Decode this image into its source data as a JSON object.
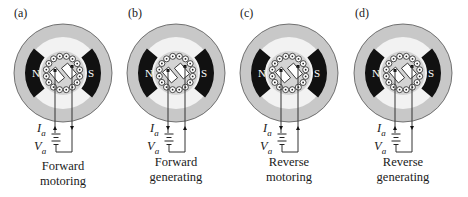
{
  "figure": {
    "panels": [
      {
        "id": "a",
        "label": "(a)",
        "caption_line1": "Forward",
        "caption_line2": "motoring",
        "mode": "forward-motoring",
        "current_left": "up",
        "current_right": "down",
        "cx": 63
      },
      {
        "id": "b",
        "label": "(b)",
        "caption_line1": "Forward",
        "caption_line2": "generating",
        "mode": "forward-generating",
        "current_left": "down",
        "current_right": "up",
        "cx": 176
      },
      {
        "id": "c",
        "label": "(c)",
        "caption_line1": "Reverse",
        "caption_line2": "motoring",
        "mode": "reverse-motoring",
        "current_left": "down",
        "current_right": "up",
        "cx": 289
      },
      {
        "id": "d",
        "label": "(d)",
        "caption_line1": "Reverse",
        "caption_line2": "generating",
        "mode": "reverse-generating",
        "current_left": "up",
        "current_right": "down",
        "cx": 403
      }
    ],
    "pole_north": "N",
    "pole_south": "S",
    "current_symbol": "I",
    "voltage_symbol": "V",
    "subscript": "a",
    "colors": {
      "stator_ring": "#c8c8c8",
      "air_gap": "#f2f2f2",
      "pole": "#111111",
      "rotor": "#d4d4d4",
      "line": "#333333"
    }
  }
}
